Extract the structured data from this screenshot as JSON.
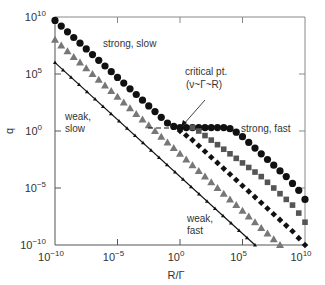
{
  "chart_data": {
    "type": "scatter",
    "title": "",
    "xlabel": "R/Γ",
    "ylabel": "q",
    "xscale": "log",
    "yscale": "log",
    "xlim_log10": [
      -10,
      10
    ],
    "ylim_log10": [
      -10,
      10
    ],
    "x_ticks": [
      "10^-10",
      "10^-5",
      "10^0",
      "10^5",
      "10^10"
    ],
    "y_ticks": [
      "10^-10",
      "10^-5",
      "10^0",
      "10^5",
      "10^10"
    ],
    "grid": false,
    "legend": null,
    "series": [
      {
        "name": "strong",
        "marker": "circle",
        "color": "#111111",
        "log10_x": [
          -10,
          -9.5,
          -9,
          -8.5,
          -8,
          -7.5,
          -7,
          -6.5,
          -6,
          -5.5,
          -5,
          -4.5,
          -4,
          -3.5,
          -3,
          -2.5,
          -2,
          -1.5,
          -1,
          -0.5,
          0,
          0.5,
          1,
          1.5,
          2,
          2.5,
          3,
          3.5,
          4,
          4.5,
          5,
          5.5,
          6,
          6.5,
          7,
          7.5,
          8,
          8.5,
          9,
          9.5,
          10
        ],
        "log10_q": [
          9.7,
          9.2,
          8.7,
          8.2,
          7.7,
          7.2,
          6.7,
          6.2,
          5.7,
          5.2,
          4.7,
          4.2,
          3.7,
          3.2,
          2.7,
          2.2,
          1.7,
          1.2,
          0.7,
          0.4,
          0.3,
          0.3,
          0.3,
          0.3,
          0.3,
          0.3,
          0.3,
          0.3,
          0.2,
          -0.1,
          -0.5,
          -1.0,
          -1.5,
          -2.0,
          -2.5,
          -3.0,
          -3.5,
          -4.0,
          -4.6,
          -5.2,
          -6.0
        ]
      },
      {
        "name": "square",
        "marker": "square",
        "color": "#555555",
        "log10_x": [
          1,
          1.5,
          2,
          2.5,
          3,
          3.5,
          4,
          4.5,
          5,
          5.5,
          6,
          6.5,
          7,
          7.5,
          8,
          8.5,
          9,
          9.5,
          10
        ],
        "log10_q": [
          0.3,
          0.0,
          -0.4,
          -0.8,
          -1.2,
          -1.6,
          -2.0,
          -2.4,
          -2.8,
          -3.2,
          -3.6,
          -4.0,
          -4.5,
          -5.0,
          -5.5,
          -6.0,
          -6.5,
          -7.2,
          -8.0
        ]
      },
      {
        "name": "diamond",
        "marker": "diamond",
        "color": "#111111",
        "log10_x": [
          0,
          0.5,
          1,
          1.5,
          2,
          2.5,
          3,
          3.5,
          4,
          4.5,
          5,
          5.5,
          6,
          6.5,
          7,
          7.5,
          8,
          8.5,
          9,
          9.5,
          10
        ],
        "log10_q": [
          0.0,
          -0.4,
          -0.8,
          -1.3,
          -1.8,
          -2.3,
          -2.8,
          -3.3,
          -3.8,
          -4.3,
          -4.8,
          -5.3,
          -5.8,
          -6.3,
          -6.8,
          -7.3,
          -7.8,
          -8.3,
          -8.8,
          -9.4,
          -10.0
        ]
      },
      {
        "name": "triangle",
        "marker": "triangle",
        "color": "#777777",
        "log10_x": [
          -10,
          -9.5,
          -9,
          -8.5,
          -8,
          -7.5,
          -7,
          -6.5,
          -6,
          -5.5,
          -5,
          -4.5,
          -4,
          -3.5,
          -3,
          -2.5,
          -2,
          -1.5,
          -1,
          -0.5,
          0,
          0.5,
          1,
          1.5,
          2,
          2.5,
          3,
          3.5,
          4,
          4.5,
          5,
          5.5,
          6,
          6.5,
          7,
          7.5,
          8
        ],
        "log10_q": [
          8.0,
          7.5,
          7.0,
          6.5,
          6.0,
          5.5,
          5.0,
          4.5,
          4.0,
          3.5,
          3.0,
          2.5,
          2.0,
          1.5,
          1.0,
          0.5,
          0.0,
          -0.5,
          -1.0,
          -1.5,
          -2.0,
          -2.5,
          -3.0,
          -3.5,
          -4.0,
          -4.5,
          -5.0,
          -5.5,
          -6.0,
          -6.5,
          -7.0,
          -7.5,
          -8.0,
          -8.5,
          -9.0,
          -9.5,
          -10.0
        ]
      },
      {
        "name": "weak",
        "marker": "small-triangle-on-line",
        "color": "#111111",
        "log10_x": [
          -10,
          -8,
          -6,
          -4,
          -2,
          0,
          2,
          4,
          6
        ],
        "log10_q": [
          6.0,
          4.0,
          2.0,
          0.0,
          -2.0,
          -4.0,
          -6.0,
          -8.0,
          -10.0
        ]
      }
    ],
    "annotations": [
      {
        "text": "strong, slow",
        "log10_x": -5.5,
        "log10_q": 7.3
      },
      {
        "text": "strong, fast",
        "log10_x": 5.2,
        "log10_q": 0.3
      },
      {
        "text": "weak, slow",
        "log10_x": -9.7,
        "log10_q": 1.0
      },
      {
        "text": "weak, fast",
        "log10_x": 2.5,
        "log10_q": -7.0
      },
      {
        "text": "critical pt. (ν~Γ~R)",
        "log10_x": 0,
        "log10_q": 0.3,
        "arrow": true
      }
    ],
    "reference_lines": [
      {
        "style": "dashed",
        "from_log10": [
          -1.5,
          0.3
        ],
        "to_log10": [
          0,
          0.3
        ]
      }
    ]
  },
  "labels": {
    "xlabel": "R/Γ",
    "ylabel": "q",
    "strong_slow": "strong, slow",
    "strong_fast": "strong, fast",
    "weak_slow_1": "weak,",
    "weak_slow_2": "slow",
    "weak_fast_1": "weak,",
    "weak_fast_2": "fast",
    "critical_1": "critical pt.",
    "critical_2": "(ν~Γ~R)"
  },
  "ticks": {
    "base": "10",
    "x": [
      "-10",
      "-5",
      "0",
      "5",
      "10"
    ],
    "y": [
      "10",
      "5",
      "0",
      "-5",
      "-10"
    ]
  }
}
